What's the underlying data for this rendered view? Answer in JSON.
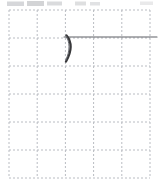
{
  "page": {
    "width": 158,
    "height": 182,
    "background_color": "#ffffff"
  },
  "grid": {
    "name": "dotted-graph-paper-grid",
    "style": "dashed",
    "line_color": "#b9bcc2",
    "line_width": 1,
    "dash_pattern": "2 2",
    "columns": 5,
    "rows": 6,
    "cell_width": 28.2,
    "cell_height": 28,
    "origin_x": 9,
    "origin_y": 10,
    "vertical_line_positions": [
      9,
      37.2,
      65.4,
      93.6,
      121.8,
      150
    ],
    "horizontal_line_positions": [
      10,
      38,
      66,
      94,
      122,
      150,
      178
    ]
  },
  "ink": {
    "color": "#3a3a3c",
    "secondary_color": "#6e7076",
    "strokes": [
      {
        "name": "horizontal-rule-stroke",
        "type": "line",
        "description": "long horizontal pen line running right from the crescent to the right edge",
        "x1": 64,
        "y1": 37,
        "x2": 157,
        "y2": 37,
        "width": 1.1,
        "color": "#5e6066"
      },
      {
        "name": "crescent-stroke",
        "type": "curve",
        "description": "short curved parenthesis-like crescent hanging below the horizontal line",
        "path": "M 66.5 35.5 C 71.5 41.5, 72.5 50.0, 66.0 61.5",
        "width": 2.3,
        "color": "#38383a"
      },
      {
        "name": "crescent-inner-stroke",
        "type": "curve",
        "description": "thin inner edge of the crescent giving it a tapered nib look",
        "path": "M 66.2 36.2 C 69.8 42.2, 70.4 50.4, 65.6 60.6",
        "width": 1.0,
        "color": "#6a6c72"
      }
    ]
  },
  "artifacts": {
    "name": "top-edge-scan-artifacts",
    "description": "faint gray smudges along the very top edge from the page scan crop",
    "color": "#b5b7bb",
    "marks": [
      {
        "x": 7,
        "y": 1.5,
        "width": 17,
        "height": 4.5,
        "opacity": 0.55
      },
      {
        "x": 27,
        "y": 1.0,
        "width": 17,
        "height": 5.0,
        "opacity": 0.6
      },
      {
        "x": 47,
        "y": 1.5,
        "width": 15,
        "height": 4.0,
        "opacity": 0.5
      },
      {
        "x": 75,
        "y": 1.5,
        "width": 11,
        "height": 4.0,
        "opacity": 0.45
      },
      {
        "x": 90,
        "y": 2.0,
        "width": 10,
        "height": 3.5,
        "opacity": 0.4
      },
      {
        "x": 140,
        "y": 1.5,
        "width": 13,
        "height": 3.5,
        "opacity": 0.3
      }
    ]
  }
}
